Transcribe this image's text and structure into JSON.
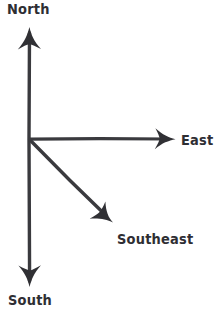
{
  "diagram": {
    "background_color": "#ffffff",
    "stroke_color": "#3a3a3e",
    "text_color": "#2e2e33",
    "origin": {
      "x": 29,
      "y": 139
    },
    "labels": {
      "north": "North",
      "east": "East",
      "southeast": "Southeast",
      "south": "South"
    },
    "arrows": [
      {
        "name": "north-arrow",
        "label": "North",
        "from": {
          "x": 29,
          "y": 139
        },
        "to": {
          "x": 29,
          "y": 29
        },
        "direction": "up",
        "bearing_degrees": 0
      },
      {
        "name": "east-arrow",
        "label": "East",
        "from": {
          "x": 29,
          "y": 139
        },
        "to": {
          "x": 174,
          "y": 139
        },
        "direction": "right",
        "bearing_degrees": 90
      },
      {
        "name": "southeast-arrow",
        "label": "Southeast",
        "from": {
          "x": 29,
          "y": 139
        },
        "to": {
          "x": 112,
          "y": 221
        },
        "direction": "down-right",
        "bearing_degrees": 135
      },
      {
        "name": "south-arrow",
        "label": "South",
        "from": {
          "x": 29,
          "y": 139
        },
        "to": {
          "x": 29,
          "y": 285
        },
        "direction": "down",
        "bearing_degrees": 180
      }
    ]
  }
}
